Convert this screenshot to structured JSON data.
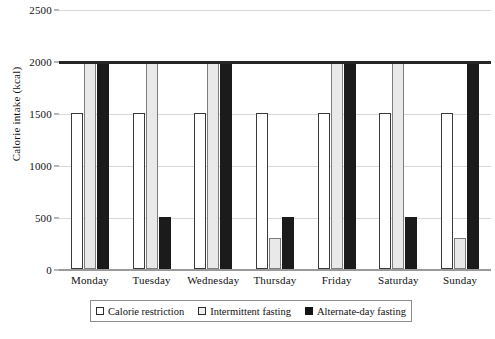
{
  "chart_data": {
    "type": "bar",
    "title": "",
    "xlabel": "",
    "ylabel": "Calorie intake (kcal)",
    "ylim": [
      0,
      2500
    ],
    "yticks": [
      0,
      500,
      1000,
      1500,
      2000,
      2500
    ],
    "ytick_labels": [
      "0",
      "500",
      "1000",
      "1500",
      "2000",
      "2500"
    ],
    "grid": true,
    "legend_position": "bottom",
    "categories": [
      "Monday",
      "Tuesday",
      "Wednesday",
      "Thursday",
      "Friday",
      "Saturday",
      "Sunday"
    ],
    "series": [
      {
        "name": "Calorie restriction",
        "color": "#ffffff",
        "values": [
          1500,
          1500,
          1500,
          1500,
          1500,
          1500,
          1500
        ]
      },
      {
        "name": "Intermittent fasting",
        "color": "#e9e9e9",
        "values": [
          2000,
          2000,
          2000,
          300,
          2000,
          2000,
          300
        ]
      },
      {
        "name": "Alternate-day fasting",
        "color": "#1b1b1b",
        "values": [
          2000,
          500,
          2000,
          500,
          2000,
          500,
          2000
        ]
      }
    ]
  }
}
